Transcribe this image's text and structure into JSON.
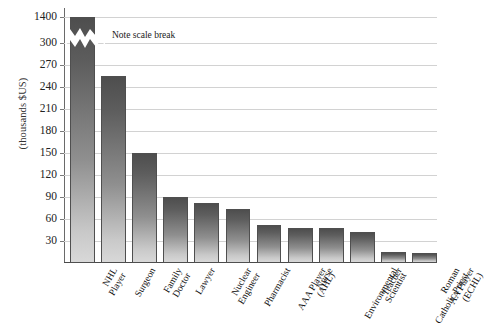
{
  "chart_data": {
    "type": "bar",
    "title": "",
    "xlabel": "",
    "ylabel": "(thousands $US)",
    "grid": true,
    "legend": null,
    "scale_break": {
      "present": true,
      "note": "Note scale break",
      "below_break_max": 300,
      "above_break_value": 1400
    },
    "yticks": [
      1400,
      300,
      270,
      240,
      210,
      180,
      150,
      120,
      90,
      60,
      30
    ],
    "ylim": [
      0,
      1400
    ],
    "categories": [
      "NHL Player",
      "Surgeon",
      "Family Doctor",
      "Lawyer",
      "Nuclear Engineer",
      "Pharmacist",
      "AAA Player (AHL)",
      "Nurse",
      "Environmental Scientist",
      "Teacher",
      "Roman Catholic Priest",
      "AA Player (ECHL)"
    ],
    "category_lines": [
      [
        "NHL",
        "Player"
      ],
      [
        "Surgeon",
        ""
      ],
      [
        "Family",
        "Doctor"
      ],
      [
        "Lawyer",
        ""
      ],
      [
        "Nuclear",
        "Engineer"
      ],
      [
        "Pharmacist",
        ""
      ],
      [
        "AAA Player",
        "(AHL)"
      ],
      [
        "Nurse",
        ""
      ],
      [
        "Environmental",
        "Scientist"
      ],
      [
        "Teacher",
        ""
      ],
      [
        "Roman",
        "Catholic Priest"
      ],
      [
        "AA Player",
        "(ECHL)"
      ]
    ],
    "values": [
      1400,
      255,
      150,
      90,
      82,
      73,
      52,
      48,
      48,
      42,
      15,
      14
    ]
  },
  "colors": {
    "bar_top": "#4e4e4e",
    "bar_bottom": "#d8d8d8",
    "bar_border": "#4f4f4f",
    "gridline": "#d2d2d2",
    "axis": "#4a4a4a",
    "text": "#1a1a1a"
  }
}
